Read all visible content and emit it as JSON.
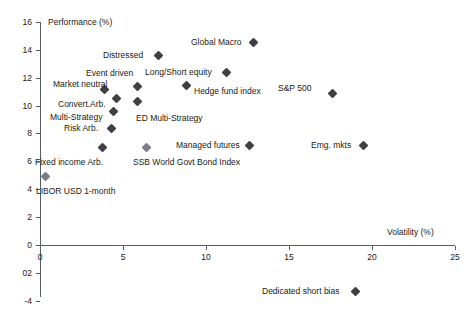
{
  "chart_data": {
    "type": "scatter",
    "title": "",
    "xlabel": "Volatility (%)",
    "ylabel": "Performance (%)",
    "xlim": [
      0,
      25
    ],
    "ylim": [
      -4,
      16
    ],
    "xticks": [
      "0",
      "5",
      "10",
      "15",
      "20",
      "25"
    ],
    "yticks": [
      "16",
      "14",
      "12",
      "10",
      "8",
      "6",
      "4",
      "2",
      "0",
      "02",
      "-4"
    ],
    "ytick_values": [
      16,
      14,
      12,
      10,
      8,
      6,
      4,
      2,
      0,
      -2,
      -4
    ],
    "xtick_values": [
      0,
      5,
      10,
      15,
      20,
      25
    ],
    "grid": false,
    "legend": "none",
    "marker_color": "#3f3f44",
    "axis_color": "#555f66",
    "points": [
      {
        "label": "Global Macro",
        "x": 12.8,
        "y": 14.6,
        "px": 253,
        "py": 42,
        "lx": 191,
        "ly": 38,
        "align": "left",
        "light": false
      },
      {
        "label": "Distressed",
        "x": 7.1,
        "y": 13.6,
        "px": 158,
        "py": 55,
        "lx": 103,
        "ly": 51,
        "align": "left",
        "light": false
      },
      {
        "label": "Long/Short equity",
        "x": 11.2,
        "y": 12.4,
        "px": 226,
        "py": 72,
        "lx": 145,
        "ly": 68,
        "align": "left",
        "light": false
      },
      {
        "label": "Event driven",
        "x": 5.8,
        "y": 11.4,
        "px": 137,
        "py": 86,
        "lx": 86,
        "ly": 69,
        "align": "left",
        "light": false
      },
      {
        "label": "Hedge fund index",
        "x": 8.8,
        "y": 11.2,
        "px": 186,
        "py": 85,
        "lx": 194,
        "ly": 87,
        "align": "left",
        "light": false
      },
      {
        "label": "Market neutral",
        "x": 3.9,
        "y": 11.2,
        "px": 104,
        "py": 89,
        "lx": 53,
        "ly": 80,
        "align": "left",
        "light": false
      },
      {
        "label": "S&P 500",
        "x": 17.6,
        "y": 10.9,
        "px": 332,
        "py": 93,
        "lx": 278,
        "ly": 84,
        "align": "left",
        "light": false
      },
      {
        "label": "Convert.Arb.",
        "x": 4.6,
        "y": 10.5,
        "px": 116,
        "py": 98,
        "lx": 58,
        "ly": 100,
        "align": "left",
        "light": false
      },
      {
        "label": "ED Multi-Strategy",
        "x": 5.8,
        "y": 10.3,
        "px": 137,
        "py": 101,
        "lx": 136,
        "ly": 114,
        "align": "left",
        "light": false
      },
      {
        "label": "Multi-Strategy",
        "x": 4.4,
        "y": 9.6,
        "px": 113,
        "py": 111,
        "lx": 50,
        "ly": 113,
        "align": "left",
        "light": false
      },
      {
        "label": "Risk Arb.",
        "x": 4.3,
        "y": 8.4,
        "px": 111,
        "py": 128,
        "lx": 64,
        "ly": 124,
        "align": "left",
        "light": false
      },
      {
        "label": "Managed futures",
        "x": 12.6,
        "y": 7.2,
        "px": 249,
        "py": 145,
        "lx": 176,
        "ly": 141,
        "align": "left",
        "light": false
      },
      {
        "label": "Emg. mkts",
        "x": 19.5,
        "y": 7.2,
        "px": 363,
        "py": 145,
        "lx": 311,
        "ly": 141,
        "align": "left",
        "light": false
      },
      {
        "label": "Fixed income Arb.",
        "x": 3.7,
        "y": 7.0,
        "px": 102,
        "py": 147,
        "lx": 35,
        "ly": 158,
        "align": "left",
        "light": false
      },
      {
        "label": "SSB World Govt Bond Index",
        "x": 6.4,
        "y": 7.0,
        "px": 146,
        "py": 147,
        "lx": 133,
        "ly": 158,
        "align": "left",
        "light": true
      },
      {
        "label": "LIBOR USD 1-month",
        "x": 0.3,
        "y": 4.9,
        "px": 45,
        "py": 176,
        "lx": 36,
        "ly": 187,
        "align": "left",
        "light": true
      },
      {
        "label": "Dedicated short bias",
        "x": 19.0,
        "y": -3.3,
        "px": 355,
        "py": 291,
        "lx": 262,
        "ly": 287,
        "align": "left",
        "light": false
      }
    ]
  }
}
